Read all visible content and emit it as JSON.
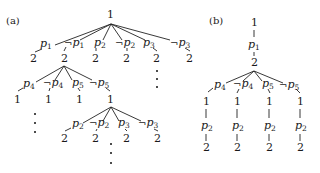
{
  "figure": {
    "panels": [
      {
        "id": "a",
        "label": "(a)",
        "root": "1",
        "level1": [
          {
            "var": "p",
            "sub": "1",
            "neg": false,
            "child": "2"
          },
          {
            "var": "p",
            "sub": "1",
            "neg": true,
            "child": "2"
          },
          {
            "var": "p",
            "sub": "2",
            "neg": false,
            "child": "2"
          },
          {
            "var": "p",
            "sub": "2",
            "neg": true,
            "child": "2"
          },
          {
            "var": "p",
            "sub": "3",
            "neg": false,
            "child": "2"
          },
          {
            "var": "p",
            "sub": "3",
            "neg": true,
            "child": "2"
          }
        ],
        "level2_from_child_index": 1,
        "level2": [
          {
            "var": "p",
            "sub": "4",
            "neg": false,
            "child": "1"
          },
          {
            "var": "p",
            "sub": "4",
            "neg": true,
            "child": "1"
          },
          {
            "var": "p",
            "sub": "5",
            "neg": false,
            "child": "1"
          },
          {
            "var": "p",
            "sub": "5",
            "neg": true,
            "child": "1"
          }
        ],
        "level3_from_child_index": 3,
        "level3": [
          {
            "var": "p",
            "sub": "2",
            "neg": false,
            "child": "2"
          },
          {
            "var": "p",
            "sub": "2",
            "neg": true,
            "child": "2"
          },
          {
            "var": "p",
            "sub": "3",
            "neg": false,
            "child": "2"
          },
          {
            "var": "p",
            "sub": "3",
            "neg": true,
            "child": "2"
          }
        ],
        "ellipsis": "⋮"
      },
      {
        "id": "b",
        "label": "(b)",
        "root": "1",
        "chain": [
          {
            "var": "p",
            "sub": "1",
            "neg": false,
            "child": "2"
          }
        ],
        "level2": [
          {
            "var": "p",
            "sub": "4",
            "neg": false,
            "child": "1",
            "tail": {
              "var": "p",
              "sub": "2",
              "child": "2"
            }
          },
          {
            "var": "p",
            "sub": "4",
            "neg": true,
            "child": "1",
            "tail": {
              "var": "p",
              "sub": "2",
              "child": "2"
            }
          },
          {
            "var": "p",
            "sub": "5",
            "neg": false,
            "child": "1",
            "tail": {
              "var": "p",
              "sub": "2",
              "child": "2"
            }
          },
          {
            "var": "p",
            "sub": "5",
            "neg": true,
            "child": "1",
            "tail": {
              "var": "p",
              "sub": "2",
              "child": "2"
            }
          }
        ]
      }
    ],
    "neg_symbol": "¬"
  }
}
